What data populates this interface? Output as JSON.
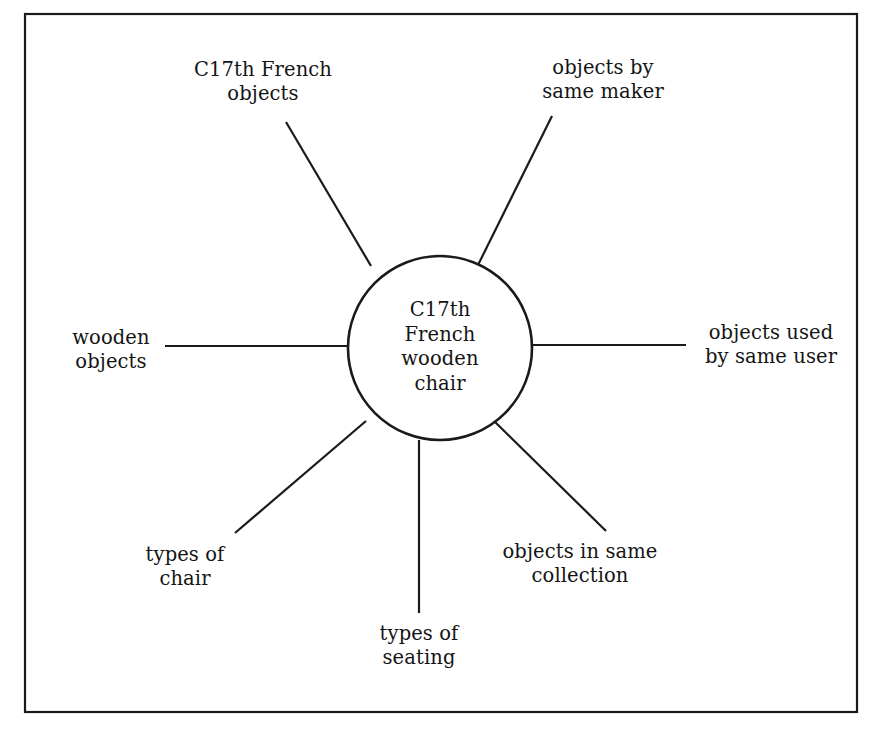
{
  "diagram": {
    "type": "radial-node-link",
    "background_color": "#ffffff",
    "stroke_color": "#1a1a1a",
    "frame": {
      "name": "outer-border",
      "x": 25,
      "y": 14,
      "width": 832,
      "height": 698,
      "stroke_width": 2.2
    },
    "center": {
      "label": "C17th\nFrench\nwooden\nchair",
      "cx": 440,
      "cy": 348,
      "r": 92,
      "stroke_width": 2.6
    },
    "nodes": [
      {
        "id": "c17th-french-objects",
        "label": "C17th French\nobjects",
        "label_x": 263,
        "label_y": 58,
        "label_width": 190,
        "spoke": {
          "x1": 286,
          "y1": 122,
          "x2": 371,
          "y2": 266
        }
      },
      {
        "id": "objects-by-same-maker",
        "label": "objects by\nsame maker",
        "label_x": 603,
        "label_y": 56,
        "label_width": 180,
        "spoke": {
          "x1": 552,
          "y1": 116,
          "x2": 478,
          "y2": 265
        }
      },
      {
        "id": "wooden-objects",
        "label": "wooden\nobjects",
        "label_x": 111,
        "label_y": 326,
        "label_width": 130,
        "spoke": {
          "x1": 165,
          "y1": 346,
          "x2": 347,
          "y2": 346
        }
      },
      {
        "id": "objects-used-by-same-user",
        "label": "objects used\nby same user",
        "label_x": 771,
        "label_y": 321,
        "label_width": 190,
        "spoke": {
          "x1": 533,
          "y1": 345,
          "x2": 686,
          "y2": 345
        }
      },
      {
        "id": "types-of-chair",
        "label": "types of\nchair",
        "label_x": 185,
        "label_y": 543,
        "label_width": 140,
        "spoke": {
          "x1": 366,
          "y1": 421,
          "x2": 235,
          "y2": 533
        }
      },
      {
        "id": "types-of-seating",
        "label": "types of\nseating",
        "label_x": 419,
        "label_y": 622,
        "label_width": 140,
        "spoke": {
          "x1": 419,
          "y1": 440,
          "x2": 419,
          "y2": 613
        }
      },
      {
        "id": "objects-in-same-collection",
        "label": "objects in same\ncollection",
        "label_x": 580,
        "label_y": 540,
        "label_width": 210,
        "spoke": {
          "x1": 492,
          "y1": 419,
          "x2": 606,
          "y2": 531
        }
      }
    ]
  }
}
